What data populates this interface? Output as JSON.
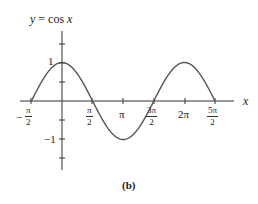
{
  "chart_data": {
    "type": "line",
    "title": "y = cos x",
    "xlabel": "x",
    "ylabel": "",
    "caption": "(b)",
    "function": "cos(x)",
    "xlim": [
      -1.5708,
      7.854
    ],
    "ylim": [
      -2,
      2
    ],
    "x_ticks": [
      {
        "value": -1.5708,
        "label": "-π/2",
        "num": "π",
        "den": "2",
        "neg": true
      },
      {
        "value": 1.5708,
        "label": "π/2",
        "num": "π",
        "den": "2",
        "neg": false
      },
      {
        "value": 3.1416,
        "label": "π"
      },
      {
        "value": 4.7124,
        "label": "3π/2",
        "num": "3π",
        "den": "2",
        "neg": false
      },
      {
        "value": 6.2832,
        "label": "2π"
      },
      {
        "value": 7.854,
        "label": "5π/2",
        "num": "5π",
        "den": "2",
        "neg": false
      }
    ],
    "y_ticks": [
      {
        "value": 1,
        "label": "1"
      },
      {
        "value": -1,
        "label": "-1"
      }
    ],
    "points": [
      {
        "x": -1.5708,
        "y": 0
      },
      {
        "x": 0,
        "y": 1
      },
      {
        "x": 1.5708,
        "y": 0
      },
      {
        "x": 3.1416,
        "y": -1
      },
      {
        "x": 4.7124,
        "y": 0
      },
      {
        "x": 6.2832,
        "y": 1
      },
      {
        "x": 7.854,
        "y": 0
      }
    ],
    "grid": false
  },
  "labels": {
    "title": "y = cos x",
    "x_axis": "x",
    "y_one": "1",
    "y_neg_one": "−1",
    "pi": "π",
    "two_pi": "2π",
    "frac_pi": "π",
    "frac_3pi": "3π",
    "frac_5pi": "5π",
    "frac_den": "2",
    "minus": "−",
    "caption": "(b)"
  }
}
